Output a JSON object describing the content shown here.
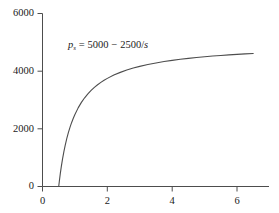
{
  "chart_data": {
    "type": "line",
    "title": "",
    "subtitle": "",
    "xlabel": "",
    "ylabel": "",
    "xlim": [
      0,
      7
    ],
    "ylim": [
      0,
      6000
    ],
    "grid": false,
    "legend": null,
    "annotations": [
      {
        "name": "supply-equation",
        "text": "p_s = 5000 - 2500/s",
        "symbol": "p",
        "subscript": "s",
        "equals": "=",
        "intercept": "5000",
        "minus": "−",
        "coefficient": "2500",
        "divider": "/",
        "variable": "s",
        "x": 1.0,
        "y": 5100
      }
    ],
    "xticks": [
      0,
      2,
      4,
      6
    ],
    "xtick_labels": [
      "0",
      "2",
      "4",
      "6"
    ],
    "yticks": [
      0,
      2000,
      4000,
      6000
    ],
    "ytick_labels": [
      "0",
      "2000",
      "4000",
      "6000"
    ],
    "series": [
      {
        "name": "supply-curve",
        "color": "#4d4d4d",
        "linewidth": 1,
        "formula": "5000 - 2500/s",
        "x_start": 0.5,
        "x_end": 6.5,
        "x": [
          0.5,
          0.52,
          0.55,
          0.58,
          0.62,
          0.66,
          0.7,
          0.75,
          0.8,
          0.85,
          0.9,
          0.95,
          1.0,
          1.1,
          1.2,
          1.3,
          1.4,
          1.5,
          1.6,
          1.7,
          1.8,
          1.9,
          2.0,
          2.2,
          2.4,
          2.6,
          2.8,
          3.0,
          3.25,
          3.5,
          3.75,
          4.0,
          4.25,
          4.5,
          4.75,
          5.0,
          5.25,
          5.5,
          5.75,
          6.0,
          6.25,
          6.5
        ],
        "values": [
          0,
          192,
          455,
          690,
          968,
          1212,
          1429,
          1667,
          1875,
          2059,
          2222,
          2368,
          2500,
          2727,
          2917,
          3077,
          3214,
          3333,
          3438,
          3529,
          3611,
          3684,
          3750,
          3864,
          3958,
          4038,
          4107,
          4167,
          4231,
          4286,
          4333,
          4375,
          4412,
          4444,
          4474,
          4500,
          4524,
          4545,
          4565,
          4583,
          4600,
          4615
        ]
      }
    ]
  },
  "axes": {
    "y_axis_name": "vertical-price-axis",
    "x_axis_name": "horizontal-quantity-axis"
  }
}
